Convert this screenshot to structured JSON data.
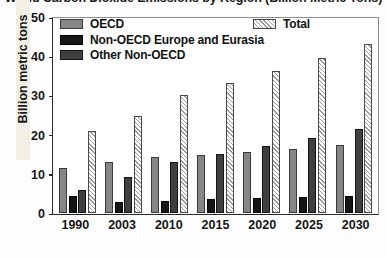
{
  "chart_data": {
    "type": "bar",
    "title": "World Carbon Dioxide Emissions by Region (Billion Metric Tons)",
    "xlabel": "",
    "ylabel": "Billion metric tons",
    "ylim": [
      0,
      50
    ],
    "yticks": [
      0,
      10,
      20,
      30,
      40,
      50
    ],
    "ytick_labels": [
      "0",
      "10",
      "20",
      "30",
      "40",
      "50"
    ],
    "grid": false,
    "legend_position": "inside-top",
    "categories": [
      "1990",
      "2003",
      "2010",
      "2015",
      "2020",
      "2025",
      "2030"
    ],
    "series": [
      {
        "name": "OECD",
        "swatch": "oecd",
        "color": "#868686",
        "values": [
          11.6,
          13.1,
          14.3,
          15.0,
          15.6,
          16.4,
          17.4
        ]
      },
      {
        "name": "Non-OECD Europe and Eurasia",
        "swatch": "noneu",
        "color": "#161616",
        "values": [
          4.2,
          2.8,
          3.1,
          3.4,
          3.7,
          4.0,
          4.3
        ]
      },
      {
        "name": "Other Non-OECD",
        "swatch": "other",
        "color": "#3f3f3f",
        "values": [
          5.8,
          9.3,
          13.1,
          15.2,
          17.2,
          19.2,
          21.6
        ]
      },
      {
        "name": "Total",
        "swatch": "total",
        "color": "#9a9a9a",
        "values": [
          21.2,
          25.0,
          30.4,
          33.6,
          36.7,
          40.0,
          43.5
        ]
      }
    ]
  }
}
